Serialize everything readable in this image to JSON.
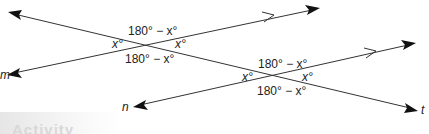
{
  "diagram": {
    "lines": {
      "transversal": {
        "label": "t",
        "x1": 10,
        "y1": 13,
        "x2": 417,
        "y2": 110
      },
      "m": {
        "label": "m",
        "x1": 8,
        "y1": 74,
        "x2": 320,
        "y2": 8
      },
      "n": {
        "label": "n",
        "x1": 135,
        "y1": 106,
        "x2": 415,
        "y2": 44
      }
    },
    "intersection1": {
      "top": "180° − x°",
      "left": "x°",
      "right": "x°",
      "bottom": "180° − x°"
    },
    "intersection2": {
      "top": "180° − x°",
      "left": "x°",
      "right": "x°",
      "bottom": "180° − x°"
    },
    "line_color": "#333333",
    "arrow_color": "#111111"
  },
  "footer": {
    "activity_label": "Activity"
  }
}
